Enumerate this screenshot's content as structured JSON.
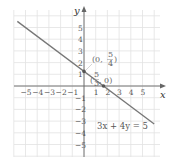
{
  "chart_data": {
    "type": "line",
    "title": "",
    "xlabel": "x",
    "ylabel": "y",
    "xlim": [
      -6,
      6.5
    ],
    "ylim": [
      -6,
      6.5
    ],
    "grid": true,
    "x_ticks": [
      "-5",
      "-4",
      "-3",
      "-2",
      "-1",
      "1",
      "2",
      "3",
      "4",
      "5"
    ],
    "y_ticks": [
      "5",
      "4",
      "3",
      "2",
      "1",
      "-1",
      "-2",
      "-3",
      "-4",
      "-5"
    ],
    "series": [
      {
        "name": "3x + 4y = 5",
        "equation": "3x + 4y = 5",
        "x": [
          -5.7,
          6
        ],
        "y": [
          5.525,
          -3.25
        ]
      }
    ],
    "points": [
      {
        "label": "(0, 5/4)",
        "x": 0,
        "y": 1.25
      },
      {
        "label": "(5/3, 0)",
        "x": 1.667,
        "y": 0
      }
    ],
    "annotations": [
      {
        "text": "3x + 4y = 5",
        "position": "lower-right"
      }
    ]
  },
  "labels": {
    "x_axis": "x",
    "y_axis": "y",
    "equation": "3x + 4y = 5",
    "point1_open": "(0, ",
    "point1_num": "5",
    "point1_den": "4",
    "point1_close": ")",
    "point2_open": "(",
    "point2_num": "5",
    "point2_den": "3",
    "point2_close": ", 0)"
  }
}
